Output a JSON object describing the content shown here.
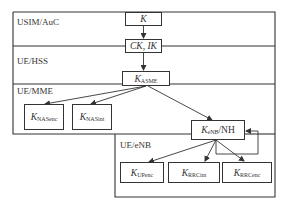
{
  "regions": {
    "usim_auc": "USIM/AuC",
    "ue_hss": "UE/HSS",
    "ue_mme": "UE/MME",
    "ue_enb": "UE/eNB"
  },
  "keys": {
    "k": {
      "main": "K",
      "sub": ""
    },
    "ck_ik": {
      "main": "CK, IK",
      "sub": ""
    },
    "k_asme": {
      "main": "K",
      "sub": "ASME"
    },
    "k_nasenc": {
      "main": "K",
      "sub": "NASenc"
    },
    "k_nasint": {
      "main": "K",
      "sub": "NASint"
    },
    "k_enb": {
      "main": "K",
      "sub": "eNB",
      "suffix": "/NH"
    },
    "k_upenc": {
      "main": "K",
      "sub": "UPenc"
    },
    "k_rrcint": {
      "main": "K",
      "sub": "RRCint"
    },
    "k_rrcenc": {
      "main": "K",
      "sub": "RRCenc"
    }
  },
  "colors": {
    "line": "#333333",
    "background": "#ffffff"
  }
}
